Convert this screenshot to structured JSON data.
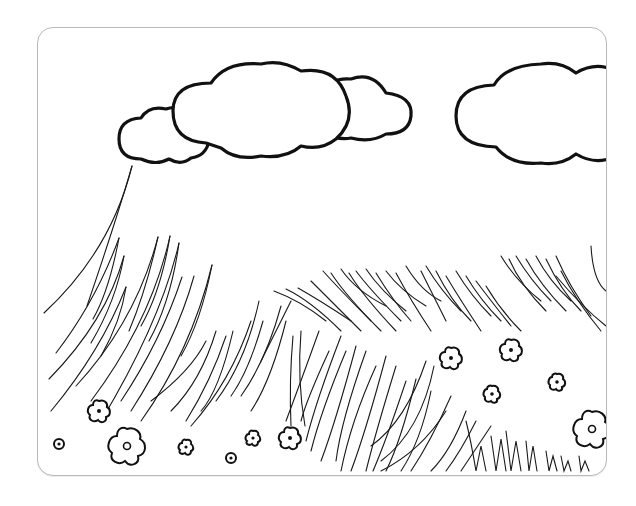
{
  "scene": {
    "title": "Grass field coloring page",
    "description": "Black-and-white line art of a grassy meadow with clouds and small flowers inside a rounded frame",
    "colors": {
      "background": "#ffffff",
      "line": "#111111",
      "frame_border": "#b9b9b9"
    },
    "elements": {
      "clouds": [
        {
          "id": "cloud-small-left",
          "x": 150,
          "y": 130
        },
        {
          "id": "cloud-large-center",
          "x": 290,
          "y": 105
        },
        {
          "id": "cloud-right",
          "x": 540,
          "y": 115
        }
      ],
      "flowers_count": 14,
      "grass_regions": [
        "left-slope",
        "middle-field",
        "right-hill-tufts",
        "bottom-right-spikes"
      ]
    }
  }
}
